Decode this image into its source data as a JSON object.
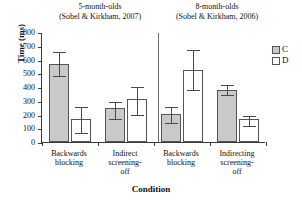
{
  "chart_data": {
    "type": "bar",
    "title": "",
    "xlabel": "Condition",
    "ylabel": "Time (ms)",
    "ylim": [
      0,
      800
    ],
    "yticks": [
      800,
      700,
      600,
      500,
      400,
      300,
      200,
      100,
      0
    ],
    "grid": false,
    "legend_position": "right",
    "panels": [
      {
        "title_line1": "5-month-olds",
        "title_line2": "(Sobel & Kirkham, 2007)"
      },
      {
        "title_line1": "8-month-olds",
        "title_line2": "(Sobel & Kirkham, 2006)"
      }
    ],
    "categories": [
      "Backwards blocking",
      "Indirect screening-off",
      "Backwards blocking",
      "Indirecting screening-off"
    ],
    "category_lines": [
      [
        "Backwards",
        "blocking"
      ],
      [
        "Indirect",
        "screening-",
        "off"
      ],
      [
        "Backwards",
        "blocking"
      ],
      [
        "Indirecting",
        "screening-",
        "off"
      ]
    ],
    "series": [
      {
        "name": "C",
        "color": "#c9c9c9",
        "values": [
          570,
          245,
          205,
          380
        ],
        "err_low": [
          480,
          165,
          140,
          340
        ],
        "err_high": [
          660,
          300,
          265,
          420
        ]
      },
      {
        "name": "D",
        "color": "#ffffff",
        "values": [
          165,
          310,
          525,
          165
        ],
        "err_low": [
          65,
          200,
          375,
          115
        ],
        "err_high": [
          265,
          405,
          680,
          200
        ]
      }
    ],
    "legend": [
      {
        "label": "C",
        "swatch": "cond-c"
      },
      {
        "label": "D",
        "swatch": "cond-d"
      }
    ]
  }
}
